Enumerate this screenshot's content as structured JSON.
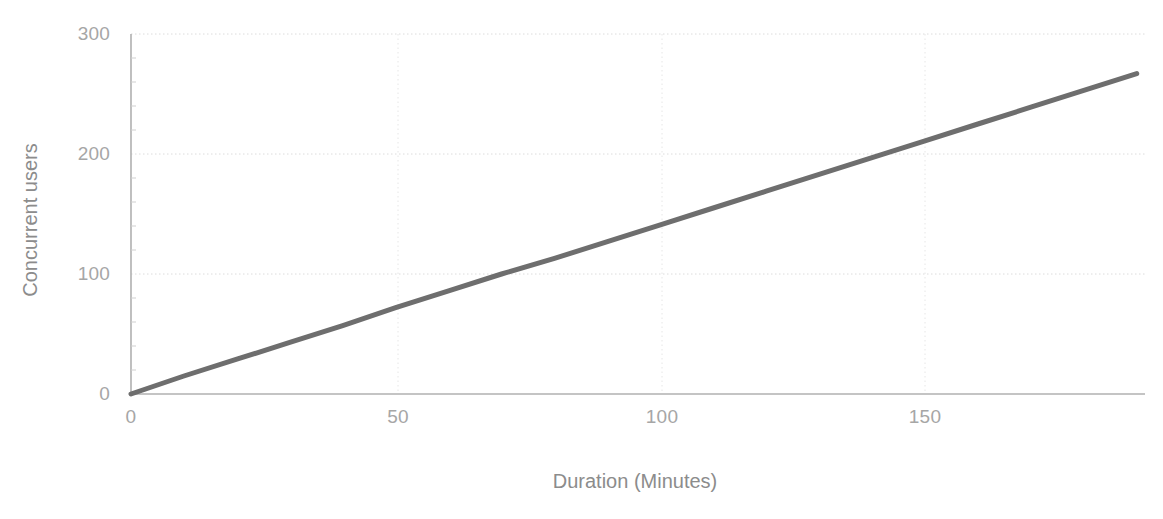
{
  "chart_data": {
    "type": "line",
    "title": "",
    "xlabel": "Duration (Minutes)",
    "ylabel": "Concurrent users",
    "xlim": [
      0,
      190
    ],
    "ylim": [
      0,
      300
    ],
    "xticks": [
      0,
      50,
      100,
      150
    ],
    "xtick_labels": [
      "0",
      "50",
      "100",
      "150"
    ],
    "yticks": [
      0,
      100,
      200,
      300
    ],
    "ytick_labels": [
      "0",
      "100",
      "200",
      "300"
    ],
    "grid": "horizontal-dotted",
    "legend": null,
    "series": [
      {
        "name": "Concurrent users",
        "color": "#6e6e6e",
        "linewidth": 5,
        "x": [
          0,
          10,
          20,
          30,
          40,
          50,
          60,
          70,
          80,
          90,
          100,
          110,
          120,
          130,
          140,
          150,
          160,
          170,
          180,
          190
        ],
        "y": [
          0,
          15,
          29,
          43,
          57,
          72,
          86,
          100,
          113,
          127,
          141,
          155,
          169,
          183,
          197,
          211,
          225,
          239,
          253,
          267
        ]
      }
    ],
    "annotations": []
  },
  "axes": {
    "x_axis_name": "x-axis",
    "y_axis_name": "y-axis"
  },
  "colors": {
    "background": "#ffffff",
    "line": "#6e6e6e",
    "grid": "#dcdcdc",
    "axis": "#b0b0b0",
    "tick_text": "#a6a6a6",
    "label_text": "#8c8c8c"
  }
}
